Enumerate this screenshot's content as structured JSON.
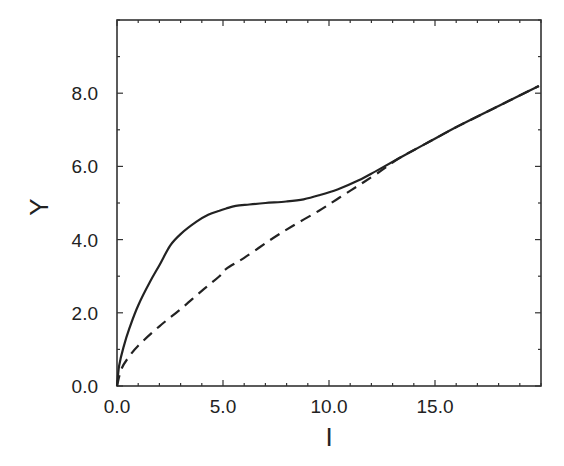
{
  "chart_data": {
    "type": "line",
    "title": "",
    "xlabel": "I",
    "ylabel": "Y",
    "xlim": [
      0,
      20
    ],
    "ylim": [
      0,
      10
    ],
    "grid": false,
    "legend": null,
    "x_ticks": [
      0,
      5,
      10,
      15
    ],
    "x_tick_labels": [
      "0.0",
      "5.0",
      "10.0",
      "15.0"
    ],
    "x_minor_step": 1,
    "y_ticks": [
      0,
      2,
      4,
      6,
      8
    ],
    "y_tick_labels": [
      "0.0",
      "2.0",
      "4.0",
      "6.0",
      "8.0"
    ],
    "y_minor_step": 1,
    "series": [
      {
        "name": "solid",
        "style": "solid",
        "color": "#222222",
        "x": [
          0,
          0.1,
          0.3,
          0.6,
          1.0,
          1.55,
          2.0,
          2.5,
          3.0,
          3.75,
          4.3,
          4.83,
          5.15,
          5.6,
          6.24,
          7.0,
          7.98,
          8.8,
          9.53,
          10.4,
          11.4,
          12.3,
          13.3,
          14.5,
          16.1,
          18.0,
          19.9
        ],
        "y": [
          0,
          0.55,
          1.05,
          1.6,
          2.2,
          2.84,
          3.3,
          3.83,
          4.15,
          4.49,
          4.68,
          4.79,
          4.85,
          4.92,
          4.96,
          5.0,
          5.04,
          5.1,
          5.21,
          5.37,
          5.62,
          5.9,
          6.22,
          6.6,
          7.1,
          7.65,
          8.2
        ]
      },
      {
        "name": "dashed",
        "style": "dashed",
        "color": "#222222",
        "x": [
          0,
          0.2,
          0.5,
          1.0,
          2.0,
          3.0,
          4.0,
          4.83,
          5.15,
          6.0,
          7.18,
          8.3,
          9.53,
          10.5,
          11.4,
          12.3,
          13.3,
          14.5,
          16.1,
          18.0,
          19.9
        ],
        "y": [
          0,
          0.45,
          0.75,
          1.1,
          1.63,
          2.1,
          2.6,
          3.0,
          3.2,
          3.5,
          3.97,
          4.38,
          4.79,
          5.15,
          5.48,
          5.82,
          6.22,
          6.6,
          7.1,
          7.65,
          8.2
        ]
      }
    ]
  }
}
